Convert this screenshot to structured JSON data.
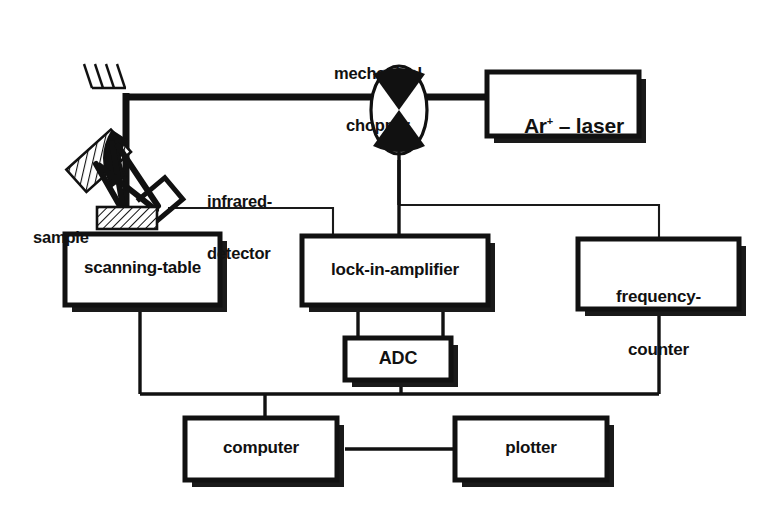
{
  "diagram": {
    "colors": {
      "ink": "#111111",
      "paper": "#ffffff",
      "shadow": "#1a1a1a",
      "thin_line": "#1a1a1a"
    },
    "free_labels": [
      {
        "id": "mechanical-chopper",
        "line1": "mechanical",
        "line2": "chopper"
      },
      {
        "id": "infrared-detector",
        "line1": "infrared-",
        "line2": "detector"
      },
      {
        "id": "sample",
        "line1": "sample"
      }
    ],
    "boxes": [
      {
        "id": "ar-laser",
        "label": "Ar",
        "sup": "+",
        "tail": " – laser"
      },
      {
        "id": "scanning-table",
        "label": "scanning-table"
      },
      {
        "id": "lock-in-amplifier",
        "label": "lock-in-amplifier"
      },
      {
        "id": "frequency-counter",
        "label_line1": "frequency-",
        "label_line2": "counter"
      },
      {
        "id": "adc",
        "label": "ADC"
      },
      {
        "id": "computer",
        "label": "computer"
      },
      {
        "id": "plotter",
        "label": "plotter"
      }
    ],
    "components": [
      {
        "id": "steering-mirror",
        "name": "steering-mirror"
      },
      {
        "id": "collecting-mirror",
        "name": "collecting-mirror"
      },
      {
        "id": "chopper-wheel",
        "name": "chopper-wheel"
      },
      {
        "id": "sample-holder",
        "name": "sample-holder"
      },
      {
        "id": "detector-element",
        "name": "detector-element"
      }
    ],
    "connections": [
      {
        "from": "ar-laser",
        "to": "chopper-wheel",
        "kind": "beam"
      },
      {
        "from": "chopper-wheel",
        "to": "steering-mirror",
        "kind": "beam"
      },
      {
        "from": "steering-mirror",
        "to": "sample-holder",
        "kind": "beam"
      },
      {
        "from": "sample-holder",
        "to": "collecting-mirror",
        "kind": "beam"
      },
      {
        "from": "collecting-mirror",
        "to": "detector-element",
        "kind": "beam"
      },
      {
        "from": "detector-element",
        "to": "lock-in-amplifier",
        "kind": "signal"
      },
      {
        "from": "chopper-wheel",
        "to": "lock-in-amplifier",
        "kind": "signal"
      },
      {
        "from": "chopper-wheel",
        "to": "frequency-counter",
        "kind": "signal"
      },
      {
        "from": "lock-in-amplifier",
        "to": "adc",
        "kind": "signal"
      },
      {
        "from": "scanning-table",
        "to": "computer",
        "kind": "bus"
      },
      {
        "from": "adc",
        "to": "computer",
        "kind": "bus"
      },
      {
        "from": "frequency-counter",
        "to": "computer",
        "kind": "bus"
      },
      {
        "from": "computer",
        "to": "plotter",
        "kind": "bus"
      }
    ]
  }
}
